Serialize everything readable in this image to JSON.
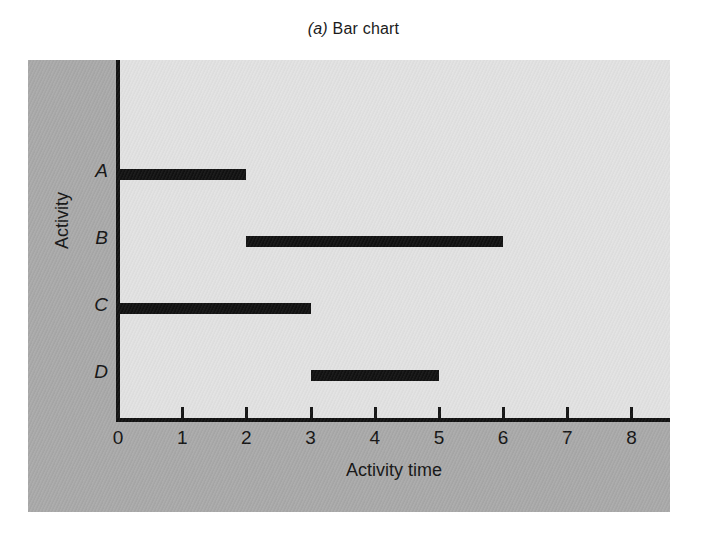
{
  "figure": {
    "caption_prefix": "(a)",
    "caption_text": "Bar chart"
  },
  "colors": {
    "panel_background": "#a9a9a9",
    "plot_background": "#e2e2e2",
    "axis": "#101010",
    "bar": "#111111",
    "page_background": "#ffffff"
  },
  "chart_data": {
    "type": "bar",
    "orientation": "horizontal",
    "title": "(a) Bar chart",
    "xlabel": "Activity time",
    "ylabel": "Activity",
    "categories": [
      "A",
      "B",
      "C",
      "D"
    ],
    "bars": [
      {
        "category": "A",
        "start": 0,
        "end": 2,
        "length": 2
      },
      {
        "category": "B",
        "start": 2,
        "end": 6,
        "length": 4
      },
      {
        "category": "C",
        "start": 0,
        "end": 3,
        "length": 3
      },
      {
        "category": "D",
        "start": 3,
        "end": 5,
        "length": 2
      }
    ],
    "xlim": [
      0,
      8.6
    ],
    "xticks": [
      0,
      1,
      2,
      3,
      4,
      5,
      6,
      7,
      8
    ],
    "xtick_labels": [
      "0",
      "1",
      "2",
      "3",
      "4",
      "5",
      "6",
      "7",
      "8"
    ],
    "grid": false,
    "legend": null
  }
}
